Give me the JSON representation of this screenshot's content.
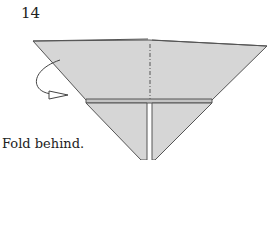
{
  "step_number": "14",
  "caption": "Fold behind.",
  "colors": {
    "paper": "#d6d6d6",
    "line": "#555555",
    "background": "#ffffff"
  },
  "symbols": [
    "valley-fold-line",
    "fold-behind-arrow"
  ]
}
